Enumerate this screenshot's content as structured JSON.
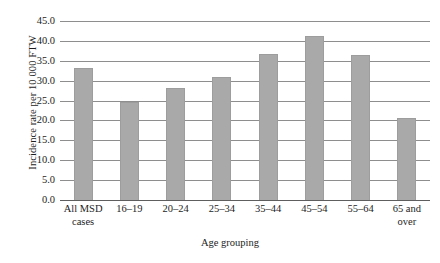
{
  "chart_data": {
    "type": "bar",
    "title": "",
    "subtitle": "",
    "xlabel": "Age grouping",
    "ylabel": "Incidence rate per 10 000 FTW",
    "categories": [
      "All MSD\ncases",
      "16–19",
      "20–24",
      "25–34",
      "35–44",
      "45–54",
      "55–64",
      "65 and\nover"
    ],
    "values": [
      33.0,
      24.3,
      28.0,
      30.6,
      36.5,
      41.0,
      36.3,
      20.3
    ],
    "ylim": [
      0.0,
      45.0
    ],
    "ytick_step": 5.0,
    "ytick_labels": [
      "45.0",
      "40.0",
      "35.0",
      "30.0",
      "25.0",
      "20.0",
      "15.0",
      "10.0",
      "5.0",
      "0.0"
    ],
    "ytick_values": [
      45.0,
      40.0,
      35.0,
      30.0,
      25.0,
      20.0,
      15.0,
      10.0,
      5.0,
      0.0
    ],
    "grid": true,
    "grid_orientation": "horizontal",
    "legend": false,
    "legend_position": "none",
    "bar_color": "#a9a9a9",
    "grid_color": "#8e8e8e",
    "axis_color": "#5e5e5e",
    "background_color": "#ffffff"
  }
}
